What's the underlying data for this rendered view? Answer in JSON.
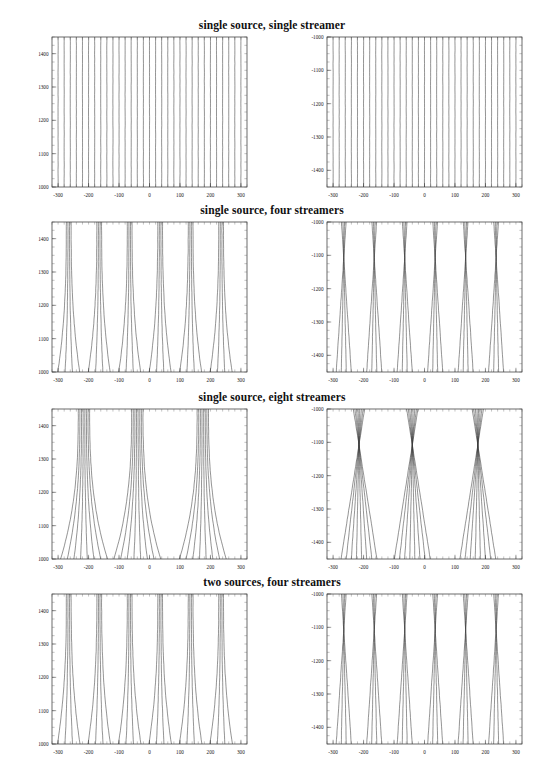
{
  "figure": {
    "background": "#ffffff",
    "line_color": "#3a3a3a",
    "frame_color": "#2b2b2b",
    "width": 544,
    "height": 775
  },
  "panels": [
    {
      "title": "single source, single streamer",
      "left": {
        "xlabel": "",
        "ylabel": "",
        "xticks": [
          "-300",
          "-200",
          "-100",
          "0",
          "100",
          "200",
          "300"
        ],
        "xtick_values": [
          -300,
          -200,
          -100,
          0,
          100,
          200,
          300
        ],
        "yticks": [
          "1000",
          "1100",
          "1200",
          "1300",
          "1400"
        ],
        "ytick_values": [
          1000,
          1100,
          1200,
          1300,
          1400
        ],
        "xlim": [
          -320,
          320
        ],
        "ylim": [
          1000,
          1450
        ]
      },
      "right": {
        "xlabel": "",
        "ylabel": "",
        "xticks": [
          "-300",
          "-200",
          "-100",
          "0",
          "100",
          "200",
          "300"
        ],
        "xtick_values": [
          -300,
          -200,
          -100,
          0,
          100,
          200,
          300
        ],
        "yticks": [
          "-1000",
          "-1100",
          "-1200",
          "-1300",
          "-1400"
        ],
        "ytick_values": [
          -1000,
          -1100,
          -1200,
          -1300,
          -1400
        ],
        "xlim": [
          -320,
          320
        ],
        "ylim": [
          -1450,
          -1000
        ]
      }
    },
    {
      "title": "single source, four streamers",
      "left": {
        "xticks": [
          "-300",
          "-200",
          "-100",
          "0",
          "100",
          "200",
          "300"
        ],
        "xtick_values": [
          -300,
          -200,
          -100,
          0,
          100,
          200,
          300
        ],
        "yticks": [
          "1000",
          "1100",
          "1200",
          "1300",
          "1400"
        ],
        "ytick_values": [
          1000,
          1100,
          1200,
          1300,
          1400
        ],
        "xlim": [
          -320,
          320
        ],
        "ylim": [
          1000,
          1450
        ]
      },
      "right": {
        "xticks": [
          "-300",
          "-200",
          "-100",
          "0",
          "100",
          "200",
          "300"
        ],
        "xtick_values": [
          -300,
          -200,
          -100,
          0,
          100,
          200,
          300
        ],
        "yticks": [
          "-1000",
          "-1100",
          "-1200",
          "-1300",
          "-1400"
        ],
        "ytick_values": [
          -1000,
          -1100,
          -1200,
          -1300,
          -1400
        ],
        "xlim": [
          -320,
          320
        ],
        "ylim": [
          -1450,
          -1000
        ]
      }
    },
    {
      "title": "single source, eight streamers",
      "left": {
        "xticks": [
          "-300",
          "-200",
          "-100",
          "0",
          "100",
          "200",
          "300"
        ],
        "xtick_values": [
          -300,
          -200,
          -100,
          0,
          100,
          200,
          300
        ],
        "yticks": [
          "1000",
          "1100",
          "1200",
          "1300",
          "1400"
        ],
        "ytick_values": [
          1000,
          1100,
          1200,
          1300,
          1400
        ],
        "xlim": [
          -320,
          320
        ],
        "ylim": [
          1000,
          1450
        ]
      },
      "right": {
        "xticks": [
          "-300",
          "-200",
          "-100",
          "0",
          "100",
          "200",
          "300"
        ],
        "xtick_values": [
          -300,
          -200,
          -100,
          0,
          100,
          200,
          300
        ],
        "yticks": [
          "-1000",
          "-1100",
          "-1200",
          "-1300",
          "-1400"
        ],
        "ytick_values": [
          -1000,
          -1100,
          -1200,
          -1300,
          -1400
        ],
        "xlim": [
          -320,
          320
        ],
        "ylim": [
          -1450,
          -1000
        ]
      }
    },
    {
      "title": "two sources, four streamers",
      "left": {
        "xticks": [
          "-300",
          "-200",
          "-100",
          "0",
          "100",
          "200",
          "300"
        ],
        "xtick_values": [
          -300,
          -200,
          -100,
          0,
          100,
          200,
          300
        ],
        "yticks": [
          "1000",
          "1100",
          "1200",
          "1300",
          "1400"
        ],
        "ytick_values": [
          1000,
          1100,
          1200,
          1300,
          1400
        ],
        "xlim": [
          -320,
          320
        ],
        "ylim": [
          1000,
          1450
        ]
      },
      "right": {
        "xticks": [
          "-300",
          "-200",
          "-100",
          "0",
          "100",
          "200",
          "300"
        ],
        "xtick_values": [
          -300,
          -200,
          -100,
          0,
          100,
          200,
          300
        ],
        "yticks": [
          "-1000",
          "-1100",
          "-1200",
          "-1300",
          "-1400"
        ],
        "ytick_values": [
          -1000,
          -1100,
          -1200,
          -1300,
          -1400
        ],
        "xlim": [
          -320,
          320
        ],
        "ylim": [
          -1450,
          -1000
        ]
      }
    }
  ],
  "chart_data": {
    "type": "line",
    "xlabel": "",
    "ylabel": "",
    "panel_titles": [
      "single source, single streamer",
      "single source, four streamers",
      "single source, eight streamers",
      "two sources, four streamers"
    ],
    "columns": [
      "left",
      "right"
    ],
    "xlim": [
      -320,
      320
    ],
    "left_ylim": [
      1000,
      1450
    ],
    "right_ylim": [
      -1450,
      -1000
    ],
    "left_yticks": [
      1000,
      1100,
      1200,
      1300,
      1400
    ],
    "right_yticks": [
      -1400,
      -1300,
      -1200,
      -1100,
      -1000
    ],
    "xticks": [
      -300,
      -200,
      -100,
      0,
      100,
      200,
      300
    ],
    "grid": false,
    "legend": "none",
    "series": [
      {
        "name": "row1-left",
        "description": "near-vertical parallel raypaths, slight outward splay at base",
        "group_size": 1,
        "group_centers": [
          -300,
          -280,
          -260,
          -240,
          -220,
          -200,
          -180,
          -160,
          -140,
          -120,
          -100,
          -80,
          -60,
          -40,
          -20,
          0,
          20,
          40,
          60,
          80,
          100,
          120,
          140,
          160,
          180,
          200,
          220,
          240,
          260,
          280,
          300
        ],
        "spread": 3,
        "curvature": 0.15,
        "crossing": false
      },
      {
        "name": "row1-right",
        "description": "near-vertical parallel raypaths, mirrored depth axis",
        "group_size": 1,
        "group_centers": [
          -300,
          -280,
          -260,
          -240,
          -220,
          -200,
          -180,
          -160,
          -140,
          -120,
          -100,
          -80,
          -60,
          -40,
          -20,
          0,
          20,
          40,
          60,
          80,
          100,
          120,
          140,
          160,
          180,
          200,
          220,
          240,
          260,
          280,
          300
        ],
        "spread": 3,
        "curvature": 0.15,
        "crossing": false
      },
      {
        "name": "row2-left",
        "description": "six fans of four raypaths each, splaying outward toward base",
        "group_size": 4,
        "group_centers": [
          -265,
          -165,
          -65,
          35,
          135,
          235
        ],
        "spread": 26,
        "curvature": 1.0,
        "crossing": false
      },
      {
        "name": "row2-right",
        "description": "six fans of four raypaths converging to focal points near -1250 m depth",
        "group_size": 4,
        "group_centers": [
          -265,
          -165,
          -65,
          35,
          135,
          235
        ],
        "spread": 26,
        "curvature": 1.0,
        "crossing": true,
        "focus_depth": -1250
      },
      {
        "name": "row3-left",
        "description": "three fans of eight raypaths each, strong outward splay at base",
        "group_size": 8,
        "group_centers": [
          -215,
          -40,
          175
        ],
        "spread": 62,
        "curvature": 1.5,
        "crossing": false
      },
      {
        "name": "row3-right",
        "description": "three fans of eight raypaths crossing at focal points near -1200 m",
        "group_size": 8,
        "group_centers": [
          -215,
          -40,
          175
        ],
        "spread": 62,
        "curvature": 1.5,
        "crossing": true,
        "focus_depth": -1200
      },
      {
        "name": "row4-left",
        "description": "two-source geometry, six fans of four raypaths",
        "group_size": 4,
        "group_centers": [
          -265,
          -165,
          -65,
          35,
          135,
          235
        ],
        "spread": 26,
        "curvature": 1.1,
        "crossing": false
      },
      {
        "name": "row4-right",
        "description": "two-source geometry, fans converging at -100 and +100 offsets",
        "group_size": 4,
        "group_centers": [
          -265,
          -165,
          -65,
          35,
          135,
          235
        ],
        "spread": 26,
        "curvature": 1.1,
        "crossing": true,
        "focus_depth": -1250
      }
    ]
  }
}
